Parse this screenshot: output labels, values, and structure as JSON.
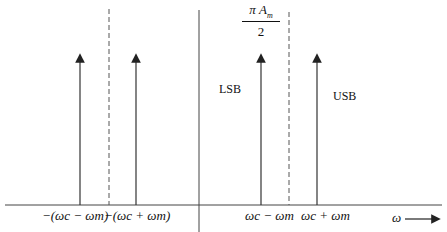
{
  "diagram": {
    "title": "",
    "peak_label": {
      "numerator": "πA_m",
      "numerator_text": "π A",
      "numerator_sub": "m",
      "denominator": "2"
    },
    "band_labels": {
      "lsb": "LSB",
      "usb": "USB"
    },
    "x_axis_label": "ω",
    "ticks": [
      {
        "text": "−(ω_c − ω_m)",
        "display": "−(ωc − ωm)",
        "x": 80
      },
      {
        "text": "−(ω_c + ω_m)",
        "display": "−(ωc + ωm)",
        "x": 136
      },
      {
        "text": "ω_c − ω_m",
        "display": "ωc − ωm",
        "x": 261
      },
      {
        "text": "ω_c + ω_m",
        "display": "ωc + ωm",
        "x": 317
      }
    ],
    "impulses_x": [
      80,
      136,
      261,
      317
    ],
    "dashed_lines_x": [
      109,
      289
    ],
    "vertical_axis_x": 199,
    "colors": {
      "line": "#222222",
      "background": "#ffffff"
    }
  }
}
